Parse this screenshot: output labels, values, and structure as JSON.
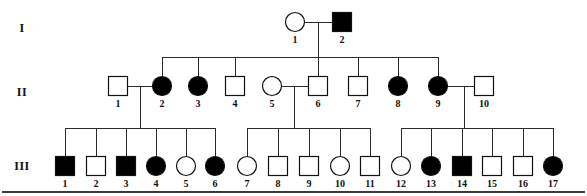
{
  "figure": {
    "symbol_legend": {
      "square": "male",
      "circle": "female",
      "filled": "affected",
      "unfilled": "unaffected"
    },
    "colors": {
      "affected_fill": "#000000",
      "unaffected_fill": "#ffffff",
      "outline": "#111111",
      "line": "#2b2b2b",
      "background": "#ffffff"
    },
    "bottom_rule": true
  },
  "generations": [
    {
      "id": "gen-1",
      "label": "I",
      "label_x": 22,
      "y": 28
    },
    {
      "id": "gen-2",
      "label": "II",
      "label_x": 22,
      "y": 92
    },
    {
      "id": "gen-3",
      "label": "III",
      "label_x": 22,
      "y": 166
    }
  ],
  "individuals": [
    {
      "gen": "I",
      "id": "1",
      "label": "1",
      "sex": "female",
      "shape": "circle",
      "affected": false,
      "x": 295,
      "y": 22,
      "size": 19
    },
    {
      "gen": "I",
      "id": "2",
      "label": "2",
      "sex": "male",
      "shape": "square",
      "affected": true,
      "x": 342,
      "y": 22,
      "size": 19
    },
    {
      "gen": "II",
      "id": "1",
      "label": "1",
      "sex": "male",
      "shape": "square",
      "affected": false,
      "x": 118,
      "y": 86,
      "size": 19
    },
    {
      "gen": "II",
      "id": "2",
      "label": "2",
      "sex": "female",
      "shape": "circle",
      "affected": true,
      "x": 162,
      "y": 86,
      "size": 19
    },
    {
      "gen": "II",
      "id": "3",
      "label": "3",
      "sex": "female",
      "shape": "circle",
      "affected": true,
      "x": 198,
      "y": 86,
      "size": 19
    },
    {
      "gen": "II",
      "id": "4",
      "label": "4",
      "sex": "male",
      "shape": "square",
      "affected": false,
      "x": 235,
      "y": 86,
      "size": 19
    },
    {
      "gen": "II",
      "id": "5",
      "label": "5",
      "sex": "female",
      "shape": "circle",
      "affected": false,
      "x": 272,
      "y": 86,
      "size": 19
    },
    {
      "gen": "II",
      "id": "6",
      "label": "6",
      "sex": "male",
      "shape": "square",
      "affected": false,
      "x": 318,
      "y": 86,
      "size": 19
    },
    {
      "gen": "II",
      "id": "7",
      "label": "7",
      "sex": "male",
      "shape": "square",
      "affected": false,
      "x": 358,
      "y": 86,
      "size": 19
    },
    {
      "gen": "II",
      "id": "8",
      "label": "8",
      "sex": "female",
      "shape": "circle",
      "affected": true,
      "x": 398,
      "y": 86,
      "size": 19
    },
    {
      "gen": "II",
      "id": "9",
      "label": "9",
      "sex": "female",
      "shape": "circle",
      "affected": true,
      "x": 438,
      "y": 86,
      "size": 19
    },
    {
      "gen": "II",
      "id": "10",
      "label": "10",
      "sex": "male",
      "shape": "square",
      "affected": false,
      "x": 484,
      "y": 86,
      "size": 19
    },
    {
      "gen": "III",
      "id": "1",
      "label": "1",
      "sex": "male",
      "shape": "square",
      "affected": true,
      "x": 65,
      "y": 166,
      "size": 19
    },
    {
      "gen": "III",
      "id": "2",
      "label": "2",
      "sex": "male",
      "shape": "square",
      "affected": false,
      "x": 96,
      "y": 166,
      "size": 19
    },
    {
      "gen": "III",
      "id": "3",
      "label": "3",
      "sex": "male",
      "shape": "square",
      "affected": true,
      "x": 126,
      "y": 166,
      "size": 19
    },
    {
      "gen": "III",
      "id": "4",
      "label": "4",
      "sex": "female",
      "shape": "circle",
      "affected": true,
      "x": 156,
      "y": 166,
      "size": 19
    },
    {
      "gen": "III",
      "id": "5",
      "label": "5",
      "sex": "female",
      "shape": "circle",
      "affected": false,
      "x": 186,
      "y": 166,
      "size": 19
    },
    {
      "gen": "III",
      "id": "6",
      "label": "6",
      "sex": "female",
      "shape": "circle",
      "affected": true,
      "x": 215,
      "y": 166,
      "size": 19
    },
    {
      "gen": "III",
      "id": "7",
      "label": "7",
      "sex": "female",
      "shape": "circle",
      "affected": false,
      "x": 247,
      "y": 166,
      "size": 19
    },
    {
      "gen": "III",
      "id": "8",
      "label": "8",
      "sex": "male",
      "shape": "square",
      "affected": false,
      "x": 278,
      "y": 166,
      "size": 19
    },
    {
      "gen": "III",
      "id": "9",
      "label": "9",
      "sex": "male",
      "shape": "square",
      "affected": false,
      "x": 309,
      "y": 166,
      "size": 19
    },
    {
      "gen": "III",
      "id": "10",
      "label": "10",
      "sex": "female",
      "shape": "circle",
      "affected": false,
      "x": 340,
      "y": 166,
      "size": 19
    },
    {
      "gen": "III",
      "id": "11",
      "label": "11",
      "sex": "male",
      "shape": "square",
      "affected": false,
      "x": 370,
      "y": 166,
      "size": 19
    },
    {
      "gen": "III",
      "id": "12",
      "label": "12",
      "sex": "female",
      "shape": "circle",
      "affected": false,
      "x": 401,
      "y": 166,
      "size": 19
    },
    {
      "gen": "III",
      "id": "13",
      "label": "13",
      "sex": "female",
      "shape": "circle",
      "affected": true,
      "x": 431,
      "y": 166,
      "size": 19
    },
    {
      "gen": "III",
      "id": "14",
      "label": "14",
      "sex": "male",
      "shape": "square",
      "affected": true,
      "x": 462,
      "y": 166,
      "size": 19
    },
    {
      "gen": "III",
      "id": "15",
      "label": "15",
      "sex": "male",
      "shape": "square",
      "affected": false,
      "x": 492,
      "y": 166,
      "size": 19
    },
    {
      "gen": "III",
      "id": "16",
      "label": "16",
      "sex": "male",
      "shape": "square",
      "affected": false,
      "x": 523,
      "y": 166,
      "size": 19
    },
    {
      "gen": "III",
      "id": "17",
      "label": "17",
      "sex": "female",
      "shape": "circle",
      "affected": true,
      "x": 553,
      "y": 166,
      "size": 19
    }
  ],
  "matings": [
    {
      "id": "mating-I-1x2",
      "partners": [
        "I-1",
        "I-2"
      ],
      "line_y": 22,
      "x1": 305,
      "x2": 332,
      "drop_x": 318,
      "drop_y1": 22,
      "drop_y2": 57
    },
    {
      "id": "mating-II-1x2",
      "partners": [
        "II-1",
        "II-2"
      ],
      "line_y": 86,
      "x1": 128,
      "x2": 152,
      "drop_x": 140,
      "drop_y1": 86,
      "drop_y2": 128
    },
    {
      "id": "mating-II-5x6",
      "partners": [
        "II-5",
        "II-6"
      ],
      "line_y": 86,
      "x1": 282,
      "x2": 308,
      "drop_x": 294,
      "drop_y1": 86,
      "drop_y2": 128
    },
    {
      "id": "mating-II-9x10",
      "partners": [
        "II-9",
        "II-10"
      ],
      "line_y": 86,
      "x1": 448,
      "x2": 474,
      "drop_x": 464,
      "drop_y1": 86,
      "drop_y2": 128
    }
  ],
  "sibships": [
    {
      "id": "sibship-gen2",
      "parents": "I-1 x I-2",
      "bar_y": 57,
      "bar_x1": 162,
      "bar_x2": 438,
      "child_x": [
        162,
        198,
        235,
        318,
        358,
        398,
        438
      ],
      "child_top_y": 77,
      "children": [
        "II-2",
        "II-3",
        "II-4",
        "II-6",
        "II-7",
        "II-8",
        "II-9"
      ]
    },
    {
      "id": "sibship-gen3-left",
      "parents": "II-1 x II-2",
      "bar_y": 128,
      "bar_x1": 65,
      "bar_x2": 215,
      "child_x": [
        65,
        96,
        126,
        156,
        186,
        215
      ],
      "child_top_y": 157,
      "children": [
        "III-1",
        "III-2",
        "III-3",
        "III-4",
        "III-5",
        "III-6"
      ]
    },
    {
      "id": "sibship-gen3-middle",
      "parents": "II-5 x II-6",
      "bar_y": 128,
      "bar_x1": 247,
      "bar_x2": 370,
      "child_x": [
        247,
        278,
        309,
        340,
        370
      ],
      "child_top_y": 157,
      "children": [
        "III-7",
        "III-8",
        "III-9",
        "III-10",
        "III-11"
      ]
    },
    {
      "id": "sibship-gen3-right",
      "parents": "II-9 x II-10",
      "bar_y": 128,
      "bar_x1": 401,
      "bar_x2": 553,
      "child_x": [
        401,
        431,
        462,
        492,
        523,
        553
      ],
      "child_top_y": 157,
      "children": [
        "III-12",
        "III-13",
        "III-14",
        "III-15",
        "III-16",
        "III-17"
      ]
    }
  ],
  "rule": {
    "y": 192,
    "x1": 2,
    "x2": 585
  }
}
